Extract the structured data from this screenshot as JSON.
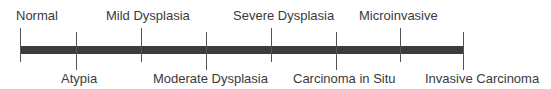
{
  "diagram": {
    "type": "timeline",
    "title": "",
    "stages": [
      {
        "label": "Normal",
        "position": "above",
        "x": 20
      },
      {
        "label": "Atypia",
        "position": "below",
        "x": 76
      },
      {
        "label": "Mild Dysplasia",
        "position": "above",
        "x": 141
      },
      {
        "label": "Moderate Dysplasia",
        "position": "below",
        "x": 206
      },
      {
        "label": "Severe Dysplasia",
        "position": "above",
        "x": 271
      },
      {
        "label": "Carcinoma in Situ",
        "position": "below",
        "x": 336
      },
      {
        "label": "Microinvasive",
        "position": "above",
        "x": 400
      },
      {
        "label": "Invasive Carcinoma",
        "position": "below",
        "x": 463
      }
    ],
    "colors": {
      "bar": "#3c3c3c",
      "tick": "#555555",
      "text": "#3a3a3a"
    }
  }
}
